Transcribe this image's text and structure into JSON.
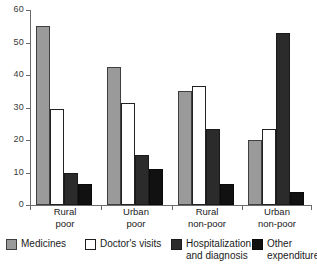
{
  "chart_data": {
    "type": "bar",
    "title": "",
    "xlabel": "",
    "ylabel": "",
    "ylim": [
      0,
      60
    ],
    "grid": false,
    "legend_position": "bottom",
    "categories": [
      "Rural poor",
      "Urban poor",
      "Rural non-poor",
      "Urban non-poor"
    ],
    "category_lines": [
      [
        "Rural",
        "poor"
      ],
      [
        "Urban",
        "poor"
      ],
      [
        "Rural",
        "non-poor"
      ],
      [
        "Urban",
        "non-poor"
      ]
    ],
    "yticks": [
      0,
      10,
      20,
      30,
      40,
      50,
      60
    ],
    "ytick_labels": [
      "0",
      "10",
      "20",
      "30",
      "40",
      "50",
      "60"
    ],
    "series": [
      {
        "name": "Medicines",
        "color": "#9a9a9a",
        "values": [
          55,
          42.5,
          35,
          20
        ]
      },
      {
        "name": "Doctor's visits",
        "color": "#ffffff",
        "values": [
          29.5,
          31.5,
          36.5,
          23.5
        ]
      },
      {
        "name": "Hospitalization and diagnosis",
        "color": "#2b2b2b",
        "values": [
          10,
          15.5,
          23.5,
          53
        ]
      },
      {
        "name": "Other expenditures",
        "color": "#111111",
        "values": [
          6.5,
          11,
          6.5,
          4
        ]
      }
    ],
    "legend": [
      {
        "label": "Medicines",
        "lines": [
          "Medicines"
        ],
        "swatch": "medicines"
      },
      {
        "label": "Doctor's visits",
        "lines": [
          "Doctor's visits"
        ],
        "swatch": "doctors"
      },
      {
        "label": "Hospitalization and diagnosis",
        "lines": [
          "Hospitalization",
          "and diagnosis"
        ],
        "swatch": "hospital"
      },
      {
        "label": "Other expenditures",
        "lines": [
          "Other",
          "expenditures"
        ],
        "swatch": "other"
      }
    ]
  }
}
